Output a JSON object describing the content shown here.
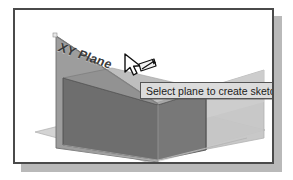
{
  "figure": {
    "caption": "",
    "frame_border_color": "#4a4a4a",
    "shadow_color": "#b9b9b9",
    "background_color": "#ffffff"
  },
  "viewport": {
    "name": "3d-modeling-viewport",
    "background_color": "#ffffff",
    "planes": [
      {
        "id": "xy-plane",
        "label": "XY Plane",
        "state": "highlighted",
        "orientation": "vertical-left",
        "fill_color": "#9a9a9a",
        "edge_color": "#6f6f6f"
      },
      {
        "id": "right-plane",
        "label": "",
        "state": "normal",
        "orientation": "vertical-right",
        "fill_color": "#c2c2c2",
        "edge_color": "#9a9a9a"
      },
      {
        "id": "base-plane",
        "label": "",
        "state": "normal",
        "orientation": "horizontal",
        "fill_color": "#cfcfcf",
        "edge_color": "#a8a8a8"
      }
    ],
    "solid": {
      "id": "box-solid",
      "front_face_color": "#6e6e6e",
      "side_face_color": "#808080",
      "top_face_color": "#8c8c8c",
      "edge_color": "#545454"
    }
  },
  "plane_label": {
    "text": "XY Plane",
    "color": "#3a3a3a"
  },
  "cursor": {
    "name": "select-sketch-plane-cursor",
    "type": "arrow-with-sketch-glyph",
    "fill_color": "#ffffff",
    "outline_color": "#101010",
    "x": 112,
    "y": 47
  },
  "tooltip": {
    "text": "Select plane to create sketch or",
    "truncated": true,
    "background_color": "#dcdcdc",
    "border_color": "#555555",
    "text_color": "#1a1a1a"
  }
}
